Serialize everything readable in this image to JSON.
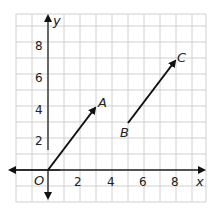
{
  "diagram": {
    "type": "coordinate-grid-vectors",
    "axes": {
      "x_label": "x",
      "y_label": "y",
      "origin_label": "O",
      "x_ticks": [
        "2",
        "4",
        "6",
        "8"
      ],
      "y_ticks": [
        "2",
        "4",
        "6",
        "8"
      ]
    },
    "points": {
      "A": {
        "label": "A",
        "x": 3,
        "y": 4
      },
      "B": {
        "label": "B",
        "x": 5,
        "y": 3
      },
      "C": {
        "label": "C",
        "x": 8,
        "y": 7
      }
    },
    "vectors": [
      {
        "from": "O",
        "to": "A"
      },
      {
        "from": "B",
        "to": "C"
      }
    ],
    "colors": {
      "grid": "#d0d0d0",
      "axis": "#222222",
      "vector": "#111111"
    }
  }
}
